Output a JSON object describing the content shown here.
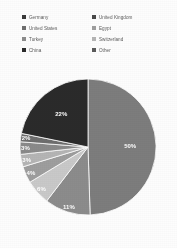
{
  "legend": {
    "columns": [
      {
        "items": [
          {
            "label": "Germany",
            "color": "#3a3a3a",
            "swatch_icon": "square-swatch-icon"
          },
          {
            "label": "United States",
            "color": "#6e6e6e",
            "swatch_icon": "square-swatch-icon"
          },
          {
            "label": "Turkey",
            "color": "#8c8c8c",
            "swatch_icon": "square-swatch-icon"
          },
          {
            "label": "China",
            "color": "#2b2b2b",
            "swatch_icon": "square-swatch-icon"
          }
        ]
      },
      {
        "items": [
          {
            "label": "United Kingdom",
            "color": "#4a4a4a",
            "swatch_icon": "square-swatch-icon"
          },
          {
            "label": "Egypt",
            "color": "#9e9e9e",
            "swatch_icon": "square-swatch-icon"
          },
          {
            "label": "Switzerland",
            "color": "#b5b5b5",
            "swatch_icon": "square-swatch-icon"
          },
          {
            "label": "Other",
            "color": "#5a5a5a",
            "swatch_icon": "square-swatch-icon"
          }
        ]
      }
    ]
  },
  "chart_data": {
    "type": "pie",
    "title": "",
    "subtitle": "",
    "xlabel": "",
    "ylabel": "",
    "grid": false,
    "legend_position": "top",
    "units": "percent",
    "categories": [
      "Germany",
      "United Kingdom",
      "United States",
      "Egypt",
      "Turkey",
      "Switzerland",
      "China",
      "Other"
    ],
    "values": [
      50,
      11,
      6,
      4,
      3,
      3,
      2,
      22
    ],
    "labels": [
      "50%",
      "11%",
      "6%",
      "4%",
      "3%",
      "3%",
      "2%",
      "22%"
    ],
    "colors": [
      "#7d7d7d",
      "#8c8c8c",
      "#c9c9c9",
      "#9e9e9e",
      "#b5b5b5",
      "#8a8a8a",
      "#6e6e6e",
      "#2b2b2b"
    ],
    "slices": [
      {
        "name": "Germany",
        "value": 50,
        "label": "50%",
        "color": "#7d7d7d",
        "label_x": 108,
        "label_y": 92
      },
      {
        "name": "United Kingdom",
        "value": 11,
        "label": "11%",
        "color": "#8c8c8c",
        "label_x": 45,
        "label_y": 152
      },
      {
        "name": "United States",
        "value": 6,
        "label": "6%",
        "color": "#c9c9c9",
        "label_x": 20,
        "label_y": 126
      },
      {
        "name": "Egypt",
        "value": 4,
        "label": "4%",
        "color": "#9e9e9e",
        "label_x": 12,
        "label_y": 109
      },
      {
        "name": "Turkey",
        "value": 3,
        "label": "3%",
        "color": "#b5b5b5",
        "label_x": 8,
        "label_y": 96
      },
      {
        "name": "Switzerland",
        "value": 3,
        "label": "3%",
        "color": "#8a8a8a",
        "label_x": 6,
        "label_y": 86
      },
      {
        "name": "China",
        "value": 2,
        "label": "2%",
        "color": "#6e6e6e",
        "label_x": 5,
        "label_y": 77
      },
      {
        "name": "Other",
        "value": 22,
        "label": "22%",
        "color": "#2b2b2b",
        "label_x": 40,
        "label_y": 40
      }
    ]
  }
}
